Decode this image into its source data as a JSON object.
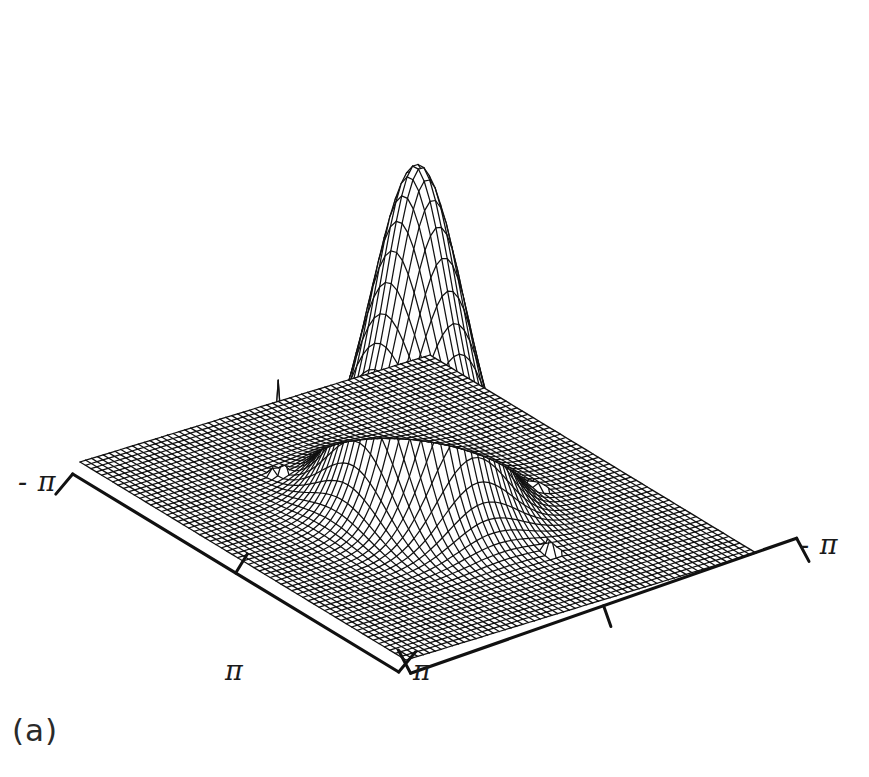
{
  "figure": {
    "caption": "(a)",
    "kind": "3d-wireframe-surface",
    "background_color": "#ffffff",
    "ink_color": "#111111"
  },
  "axes": {
    "left_label": "- π",
    "right_label": "- π",
    "front_left_label": "π",
    "front_right_label": "π",
    "tick_count_per_axis": 1
  },
  "chart_data": {
    "type": "surface",
    "title": "",
    "subtitle": "",
    "xlabel": "",
    "ylabel": "",
    "zlabel": "",
    "projection": "isometric-wireframe",
    "grid": true,
    "legend": "none",
    "xlim": [
      -3.14159,
      3.14159
    ],
    "ylim": [
      -3.14159,
      3.14159
    ],
    "zlim": [
      0,
      1
    ],
    "xtick_labels": [
      "- π",
      "π"
    ],
    "ytick_labels": [
      "π",
      "- π"
    ],
    "grid_n": 61,
    "components": [
      {
        "name": "central-peak",
        "shape": "gaussian",
        "cx": 0.0,
        "cy": 0.0,
        "amplitude": 1.0,
        "sigma": 0.62
      },
      {
        "name": "spike-back-left",
        "shape": "impulse",
        "cx": -1.55,
        "cy": 1.05,
        "amplitude": 0.3,
        "sigma": 0.045
      },
      {
        "name": "spike-front-center",
        "shape": "impulse",
        "cx": 0.45,
        "cy": -1.75,
        "amplitude": 0.27,
        "sigma": 0.045
      },
      {
        "name": "spike-front-right",
        "shape": "impulse",
        "cx": 1.85,
        "cy": -0.7,
        "amplitude": 0.26,
        "sigma": 0.045
      }
    ],
    "annotations": []
  },
  "geometry": {
    "corner_left": [
      80,
      462
    ],
    "corner_front": [
      406,
      660
    ],
    "corner_right": [
      792,
      525
    ],
    "corner_back": [
      430,
      355
    ],
    "peak_apex": [
      440,
      12
    ]
  }
}
